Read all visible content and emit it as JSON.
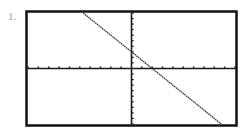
{
  "problem": {
    "number_label": "1."
  },
  "chart_data": {
    "type": "line",
    "title": "",
    "xlabel": "",
    "ylabel": "",
    "xlim": [
      -10,
      10
    ],
    "ylim": [
      -10,
      10
    ],
    "x_tick_step": 1,
    "y_tick_step": 1,
    "grid": false,
    "legend": "none",
    "axes": "crosshair-at-origin",
    "series": [
      {
        "name": "line",
        "equation": "y = -1.5x + 3",
        "slope": -1.5,
        "intercept": 3,
        "x": [
          -4.67,
          8.67
        ],
        "y": [
          10,
          -10
        ],
        "style": "dotted-pixel",
        "color": "#3a3a3a"
      }
    ],
    "colors": {
      "frame": "#111111",
      "axes": "#1a1a1a",
      "ticks": "#1a1a1a"
    }
  }
}
